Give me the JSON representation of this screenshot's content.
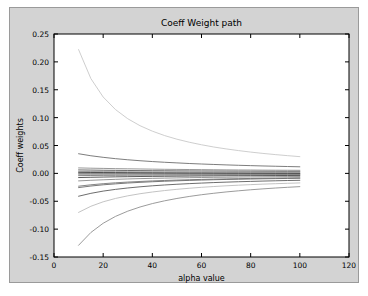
{
  "chart_data": {
    "type": "line",
    "title": "Coeff Weight path",
    "xlabel": "alpha value",
    "ylabel": "Coeff weights",
    "xlim": [
      0,
      120
    ],
    "ylim": [
      -0.15,
      0.25
    ],
    "xticks": [
      0,
      20,
      40,
      60,
      80,
      100,
      120
    ],
    "xtick_labels": [
      "0",
      "20",
      "40",
      "60",
      "80",
      "100",
      "120"
    ],
    "yticks": [
      -0.15,
      -0.1,
      -0.05,
      0.0,
      0.05,
      0.1,
      0.15,
      0.2,
      0.25
    ],
    "ytick_labels": [
      "-0.15",
      "-0.10",
      "-0.05",
      "0.00",
      "0.05",
      "0.10",
      "0.15",
      "0.20",
      "0.25"
    ],
    "grid": false,
    "legend": "none",
    "x_data_range": [
      10,
      100
    ],
    "x": [
      10,
      15,
      20,
      25,
      30,
      35,
      40,
      45,
      50,
      55,
      60,
      65,
      70,
      75,
      80,
      85,
      90,
      95,
      100
    ],
    "series": [
      {
        "name": "coef-1",
        "color": "#c8c8c8",
        "values": [
          0.222,
          0.17,
          0.137,
          0.1145,
          0.098,
          0.0855,
          0.0757,
          0.0678,
          0.0613,
          0.0559,
          0.0513,
          0.0473,
          0.0439,
          0.0409,
          0.0382,
          0.0358,
          0.0337,
          0.0318,
          0.03
        ]
      },
      {
        "name": "coef-2",
        "color": "#6e6e6e",
        "values": [
          0.0352,
          0.0316,
          0.0288,
          0.0264,
          0.0244,
          0.0227,
          0.0212,
          0.0199,
          0.0188,
          0.0177,
          0.0168,
          0.016,
          0.0152,
          0.0145,
          0.0139,
          0.0133,
          0.0128,
          0.0123,
          0.0118
        ]
      },
      {
        "name": "coef-3",
        "color": "#8c8c8c",
        "values": [
          0.0098,
          0.0093,
          0.0089,
          0.0085,
          0.0082,
          0.0079,
          0.0076,
          0.0073,
          0.0071,
          0.0069,
          0.0067,
          0.0065,
          0.0063,
          0.0061,
          0.006,
          0.0058,
          0.0057,
          0.0056,
          0.0055
        ]
      },
      {
        "name": "coef-4",
        "color": "#5a5a5a",
        "values": [
          0.0062,
          0.0059,
          0.0056,
          0.0054,
          0.0052,
          0.005,
          0.0048,
          0.0047,
          0.0045,
          0.0044,
          0.0043,
          0.0042,
          0.0041,
          0.004,
          0.0039,
          0.0038,
          0.0037,
          0.0036,
          0.0036
        ]
      },
      {
        "name": "coef-5",
        "color": "#9a9a9a",
        "values": [
          0.0035,
          0.0033,
          0.0032,
          0.0031,
          0.003,
          0.0029,
          0.0028,
          0.0027,
          0.0027,
          0.0026,
          0.0025,
          0.0025,
          0.0024,
          0.0024,
          0.0023,
          0.0023,
          0.0022,
          0.0022,
          0.0021
        ]
      },
      {
        "name": "coef-6",
        "color": "#3c3c3c",
        "values": [
          0.0018,
          0.0016,
          0.0015,
          0.0014,
          0.0013,
          0.0012,
          0.0011,
          0.001,
          0.0009,
          0.0008,
          0.0008,
          0.0007,
          0.0006,
          0.0006,
          0.0005,
          0.0005,
          0.0004,
          0.0004,
          0.0003
        ]
      },
      {
        "name": "coef-7",
        "color": "#2a2a2a",
        "values": [
          -0.001,
          -0.001,
          -0.001,
          -0.001,
          -0.001,
          -0.001,
          -0.001,
          -0.001,
          -0.001,
          -0.001,
          -0.001,
          -0.001,
          -0.001,
          -0.001,
          -0.001,
          -0.001,
          -0.001,
          -0.001,
          -0.001
        ]
      },
      {
        "name": "coef-8",
        "color": "#7a7a7a",
        "values": [
          -0.004,
          -0.0038,
          -0.0036,
          -0.0035,
          -0.0034,
          -0.0033,
          -0.0032,
          -0.0031,
          -0.003,
          -0.0029,
          -0.0029,
          -0.0028,
          -0.0027,
          -0.0027,
          -0.0026,
          -0.0026,
          -0.0025,
          -0.0025,
          -0.0024
        ]
      },
      {
        "name": "coef-9",
        "color": "#4a4a4a",
        "values": [
          -0.0075,
          -0.007,
          -0.0066,
          -0.0062,
          -0.0059,
          -0.0056,
          -0.0054,
          -0.0052,
          -0.005,
          -0.0048,
          -0.0046,
          -0.0045,
          -0.0043,
          -0.0042,
          -0.0041,
          -0.004,
          -0.0039,
          -0.0038,
          -0.0037
        ]
      },
      {
        "name": "coef-10",
        "color": "#8a8a8a",
        "values": [
          -0.0135,
          -0.0124,
          -0.0115,
          -0.0107,
          -0.01,
          -0.0094,
          -0.0089,
          -0.0085,
          -0.0081,
          -0.0077,
          -0.0074,
          -0.0071,
          -0.0069,
          -0.0066,
          -0.0064,
          -0.0062,
          -0.006,
          -0.0058,
          -0.0057
        ]
      },
      {
        "name": "coef-11",
        "color": "#787878",
        "values": [
          -0.023,
          -0.0205,
          -0.0185,
          -0.0169,
          -0.0156,
          -0.0145,
          -0.0135,
          -0.0127,
          -0.012,
          -0.0114,
          -0.0108,
          -0.0103,
          -0.0099,
          -0.0095,
          -0.0091,
          -0.0088,
          -0.0085,
          -0.0082,
          -0.0079
        ]
      },
      {
        "name": "coef-12",
        "color": "#6a6a6a",
        "values": [
          -0.0255,
          -0.0227,
          -0.0205,
          -0.0188,
          -0.0173,
          -0.0161,
          -0.015,
          -0.0141,
          -0.0133,
          -0.0126,
          -0.012,
          -0.0114,
          -0.0109,
          -0.0105,
          -0.0101,
          -0.0097,
          -0.0094,
          -0.0091,
          -0.0088
        ]
      },
      {
        "name": "coef-13",
        "color": "#5c5c5c",
        "values": [
          -0.041,
          -0.0358,
          -0.0318,
          -0.0287,
          -0.0262,
          -0.0241,
          -0.0223,
          -0.0208,
          -0.0195,
          -0.0184,
          -0.0174,
          -0.0165,
          -0.0157,
          -0.015,
          -0.0144,
          -0.0138,
          -0.0133,
          -0.0128,
          -0.0124
        ]
      },
      {
        "name": "coef-14",
        "color": "#bcbcbc",
        "values": [
          -0.07,
          -0.059,
          -0.051,
          -0.045,
          -0.0403,
          -0.0365,
          -0.0334,
          -0.0308,
          -0.0286,
          -0.0267,
          -0.025,
          -0.0236,
          -0.0223,
          -0.0212,
          -0.0202,
          -0.0193,
          -0.0185,
          -0.0178,
          -0.0171
        ]
      },
      {
        "name": "coef-15",
        "color": "#909090",
        "values": [
          -0.129,
          -0.106,
          -0.0895,
          -0.0772,
          -0.0678,
          -0.0603,
          -0.0542,
          -0.0492,
          -0.045,
          -0.0414,
          -0.0383,
          -0.0357,
          -0.0333,
          -0.0313,
          -0.0294,
          -0.0278,
          -0.0263,
          -0.025,
          -0.0238
        ]
      }
    ]
  }
}
